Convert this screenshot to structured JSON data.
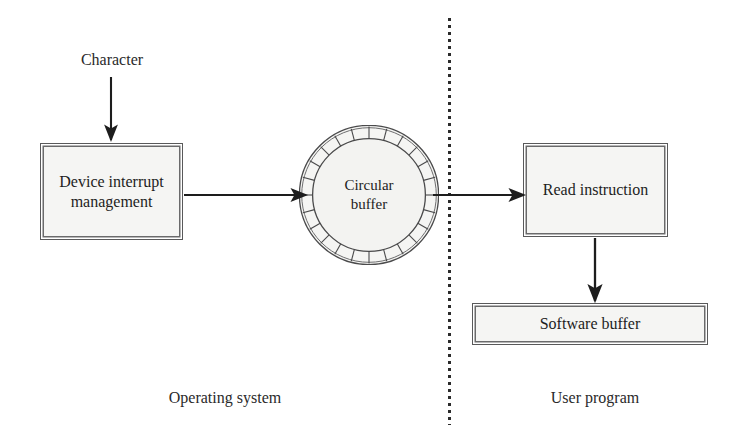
{
  "diagram": {
    "background_color": "#ffffff",
    "line_color": "#1d1d1d",
    "box_fill_color": "#f5f5f3",
    "box_border_color": "#59595a",
    "nodes": {
      "character": {
        "label": "Character"
      },
      "device_box": {
        "label": "Device interrupt management"
      },
      "circular_buffer": {
        "label_line1": "Circular",
        "label_line2": "buffer",
        "segments": 24
      },
      "read_box": {
        "label": "Read instruction"
      },
      "software_buffer_box": {
        "label": "Software buffer"
      }
    },
    "regions": {
      "left": {
        "label": "Operating system"
      },
      "right": {
        "label": "User program"
      }
    },
    "divider": {
      "style": "dotted",
      "color": "#2b2b2b"
    },
    "edges": [
      {
        "from": "character",
        "to": "device_box",
        "direction": "down"
      },
      {
        "from": "device_box",
        "to": "circular_buffer",
        "direction": "right"
      },
      {
        "from": "circular_buffer",
        "to": "read_box",
        "direction": "right"
      },
      {
        "from": "read_box",
        "to": "software_buffer_box",
        "direction": "down"
      }
    ]
  }
}
